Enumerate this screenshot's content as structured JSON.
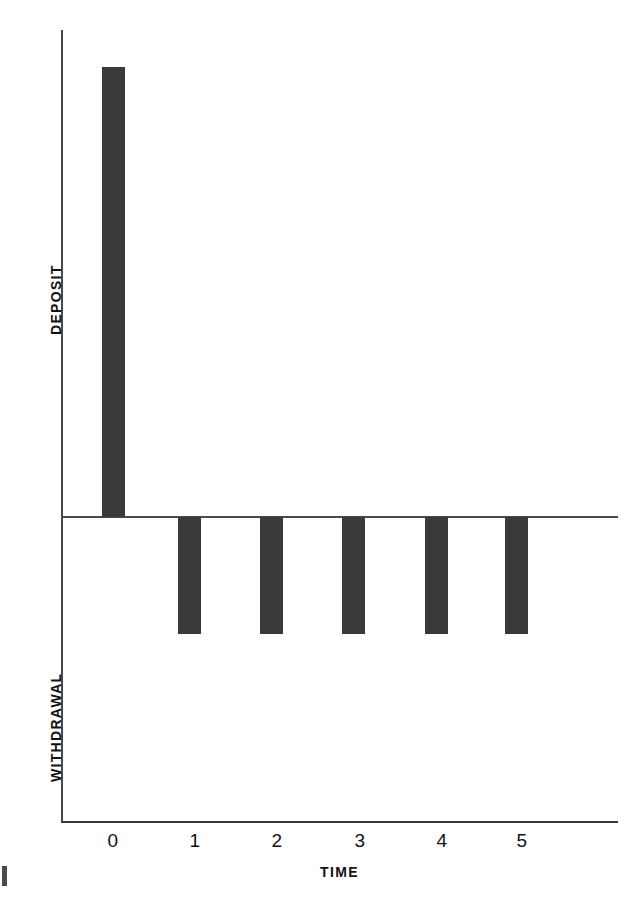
{
  "figure": {
    "background_color": "#ffffff",
    "bar_color": "#3a3a3a",
    "axis_color": "#4a4a4a",
    "text_color": "#111111",
    "edge_artifact_label": "page-edge-mark"
  },
  "axes": {
    "x_title": "TIME",
    "y_title_positive": "DEPOSIT",
    "y_title_negative": "WITHDRAWAL",
    "x_tick_labels": [
      "0",
      "1",
      "2",
      "3",
      "4",
      "5"
    ]
  },
  "chart_data": {
    "type": "bar",
    "title": "",
    "subtitle": "",
    "xlabel": "TIME",
    "ylabel": "DEPOSIT / WITHDRAWAL",
    "ylabel_positive": "DEPOSIT",
    "ylabel_negative": "WITHDRAWAL",
    "categories": [
      "0",
      "1",
      "2",
      "3",
      "4",
      "5"
    ],
    "x": [
      0,
      1,
      2,
      3,
      4,
      5
    ],
    "values": [
      5.0,
      -1.3,
      -1.3,
      -1.3,
      -1.3,
      -1.3
    ],
    "series": [
      {
        "name": "Cash flow",
        "values": [
          5.0,
          -1.3,
          -1.3,
          -1.3,
          -1.3,
          -1.3
        ]
      }
    ],
    "bar_directions": [
      "up",
      "down",
      "down",
      "down",
      "down",
      "down"
    ],
    "ylim": [
      -3.4,
      5.0
    ],
    "xlim": [
      -0.65,
      6.2
    ],
    "grid": false,
    "legend": "none",
    "zero_line": true,
    "annotations": [
      "Single large deposit at time 0",
      "Five equal withdrawals at times 1 through 5"
    ]
  },
  "geometry": {
    "plot_left": 61,
    "plot_right": 618,
    "plot_top": 30,
    "plot_bottom": 822,
    "zero_line_y": 517,
    "bar_width": 23,
    "tick_x_positions": [
      113,
      195,
      277,
      360,
      442,
      522
    ],
    "bar_left_positions": [
      102,
      178,
      260,
      342,
      425,
      505
    ],
    "deposit_bar_top": 67,
    "withdrawal_bar_bottom": 634
  }
}
